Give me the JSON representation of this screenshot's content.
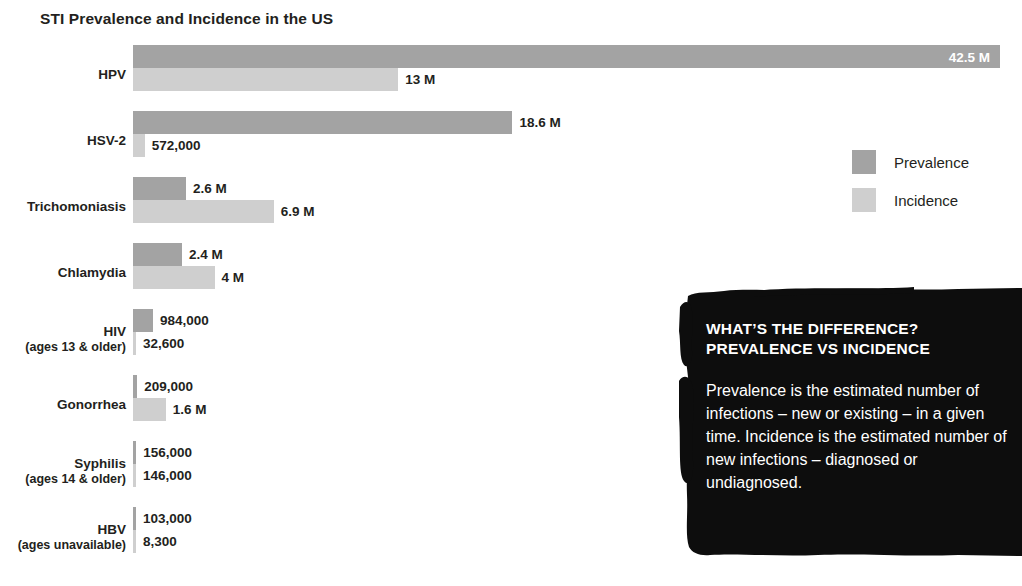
{
  "chart_data": {
    "type": "bar",
    "title": "STI Prevalence and Incidence in the US",
    "orientation": "horizontal",
    "grouping": "grouped",
    "xlabel": "",
    "ylabel": "",
    "grid": false,
    "xlim": [
      0,
      42500000
    ],
    "legend_position": "right",
    "categories": [
      "HPV",
      "HSV-2",
      "Trichomoniasis",
      "Chlamydia",
      "HIV",
      "Gonorrhea",
      "Syphilis",
      "HBV"
    ],
    "category_sublabels": [
      "",
      "",
      "",
      "",
      "(ages 13 & older)",
      "",
      "(ages 14 & older)",
      "(ages unavailable)"
    ],
    "series": [
      {
        "name": "Prevalence",
        "color": "#a3a3a3",
        "values": [
          42500000,
          18600000,
          2600000,
          2400000,
          984000,
          209000,
          156000,
          103000
        ],
        "labels": [
          "42.5 M",
          "18.6 M",
          "2.6 M",
          "2.4 M",
          "984,000",
          "209,000",
          "156,000",
          "103,000"
        ]
      },
      {
        "name": "Incidence",
        "color": "#cfcfcf",
        "values": [
          13000000,
          572000,
          6900000,
          4000000,
          32600,
          1600000,
          146000,
          8300
        ],
        "labels": [
          "13 M",
          "572,000",
          "6.9 M",
          "4 M",
          "32,600",
          "1.6 M",
          "146,000",
          "8,300"
        ]
      }
    ]
  },
  "legend": {
    "items": [
      {
        "label": "Prevalence",
        "swatch": "prevalence-swatch"
      },
      {
        "label": "Incidence",
        "swatch": "incidence-swatch"
      }
    ]
  },
  "callout": {
    "heading_line1": "WHAT’S THE DIFFERENCE?",
    "heading_line2": "PREVALENCE VS INCIDENCE",
    "body": "Prevalence is the estimated number of infections – new or existing – in a given time. Incidence is the estimated number of new infections – diagnosed or undiagnosed.",
    "background_color": "#0d0d0d",
    "text_color": "#ffffff"
  },
  "colors": {
    "prevalence": "#a3a3a3",
    "incidence": "#cfcfcf",
    "text": "#231f20",
    "background": "#ffffff"
  }
}
